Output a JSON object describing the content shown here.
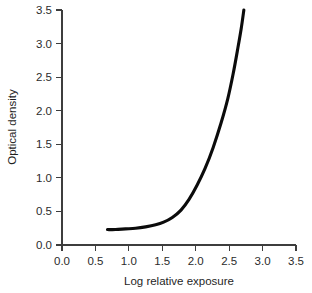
{
  "chart_data": {
    "type": "line",
    "title": "",
    "subtitle": "",
    "xlabel": "Log relative exposure",
    "ylabel": "Optical density",
    "xlim": [
      0.0,
      3.5
    ],
    "ylim": [
      0.0,
      3.5
    ],
    "grid": false,
    "legend": null,
    "legend_position": "none",
    "xticks": [
      "0.0",
      "0.5",
      "1.0",
      "1.5",
      "2.0",
      "2.5",
      "3.0",
      "3.5"
    ],
    "xtick_values": [
      0.0,
      0.5,
      1.0,
      1.5,
      2.0,
      2.5,
      3.0,
      3.5
    ],
    "yticks": [
      "0.0",
      "0.5",
      "1.0",
      "1.5",
      "2.0",
      "2.5",
      "3.0",
      "3.5"
    ],
    "ytick_values": [
      0.0,
      0.5,
      1.0,
      1.5,
      2.0,
      2.5,
      3.0,
      3.5
    ],
    "series": [
      {
        "name": "Characteristic curve",
        "color": "#0b0b0b",
        "x": [
          0.68,
          0.8,
          0.95,
          1.1,
          1.25,
          1.4,
          1.52,
          1.65,
          1.78,
          1.9,
          2.02,
          2.14,
          2.26,
          2.38,
          2.48,
          2.56,
          2.63,
          2.68,
          2.72
        ],
        "y": [
          0.23,
          0.23,
          0.24,
          0.25,
          0.27,
          0.3,
          0.34,
          0.41,
          0.52,
          0.68,
          0.89,
          1.14,
          1.45,
          1.82,
          2.18,
          2.55,
          2.93,
          3.22,
          3.5
        ]
      }
    ],
    "annotations": []
  },
  "axes": {
    "x_axis_name": "x-axis",
    "y_axis_name": "y-axis"
  }
}
